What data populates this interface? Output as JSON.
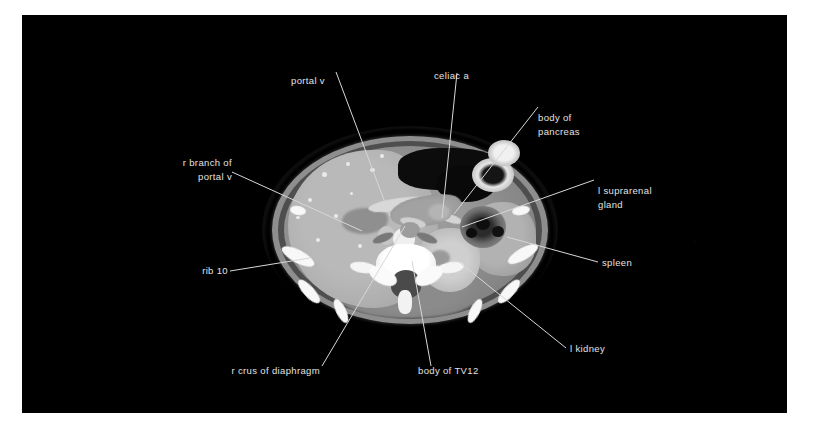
{
  "figure": {
    "modality": "CT",
    "region": "abdomen",
    "plane": "axial",
    "background_color": "#000000",
    "page_color": "#ffffff",
    "label_color": "#e2e2e2",
    "leader_color": "#d7d7d7"
  },
  "labels": [
    {
      "id": "portal-v",
      "text": "portal v"
    },
    {
      "id": "celiac-a",
      "text": "celiac a"
    },
    {
      "id": "body-of-pancreas-1",
      "text": "body of"
    },
    {
      "id": "body-of-pancreas-2",
      "text": "pancreas"
    },
    {
      "id": "r-branch-portal-v-1",
      "text": "r branch of"
    },
    {
      "id": "r-branch-portal-v-2",
      "text": "portal v"
    },
    {
      "id": "l-suprarenal-1",
      "text": "l suprarenal"
    },
    {
      "id": "l-suprarenal-2",
      "text": "gland"
    },
    {
      "id": "spleen",
      "text": "spleen"
    },
    {
      "id": "rib-10",
      "text": "rib 10"
    },
    {
      "id": "l-kidney",
      "text": "l kidney"
    },
    {
      "id": "r-crus-diaphragm",
      "text": "r crus of diaphragm"
    },
    {
      "id": "body-of-tv12",
      "text": "body of TV12"
    }
  ],
  "structures": [
    {
      "id": "liver",
      "name": "liver"
    },
    {
      "id": "portal-vein",
      "name": "portal vein"
    },
    {
      "id": "r-portal-branch",
      "name": "right branch of portal vein"
    },
    {
      "id": "celiac-artery",
      "name": "celiac artery"
    },
    {
      "id": "aorta",
      "name": "aorta"
    },
    {
      "id": "ivc",
      "name": "inferior vena cava"
    },
    {
      "id": "pancreas",
      "name": "body of pancreas"
    },
    {
      "id": "stomach",
      "name": "stomach"
    },
    {
      "id": "spleen",
      "name": "spleen"
    },
    {
      "id": "l-kidney",
      "name": "left kidney"
    },
    {
      "id": "l-suprarenal",
      "name": "left suprarenal gland"
    },
    {
      "id": "vertebra-tv12",
      "name": "body of TV12"
    },
    {
      "id": "spinal-canal",
      "name": "spinal canal"
    },
    {
      "id": "r-crus",
      "name": "right crus of diaphragm"
    },
    {
      "id": "l-crus",
      "name": "left crus of diaphragm"
    },
    {
      "id": "rib-10",
      "name": "rib 10"
    },
    {
      "id": "paraspinal",
      "name": "paraspinal muscles"
    },
    {
      "id": "bowel",
      "name": "bowel loops"
    }
  ]
}
